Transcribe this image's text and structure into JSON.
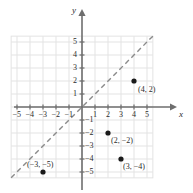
{
  "chart_data": {
    "type": "scatter",
    "title": "",
    "xlabel": "x",
    "ylabel": "y",
    "xlim": [
      -5.9,
      5.9
    ],
    "ylim": [
      -5.9,
      5.9
    ],
    "grid": true,
    "legend": "none",
    "x_ticks": [
      {
        "value": -5,
        "label": "−5"
      },
      {
        "value": -4,
        "label": "−4"
      },
      {
        "value": -3,
        "label": "−3"
      },
      {
        "value": -2,
        "label": "−2"
      },
      {
        "value": -1,
        "label": "−1"
      },
      {
        "value": 1,
        "label": "1"
      },
      {
        "value": 2,
        "label": "2"
      },
      {
        "value": 3,
        "label": "3"
      },
      {
        "value": 4,
        "label": "4"
      },
      {
        "value": 5,
        "label": "5"
      }
    ],
    "y_ticks": [
      {
        "value": 5,
        "label": "5"
      },
      {
        "value": 4,
        "label": "4"
      },
      {
        "value": 3,
        "label": "3"
      },
      {
        "value": 2,
        "label": "2"
      },
      {
        "value": 1,
        "label": "1"
      },
      {
        "value": -1,
        "label": "−1"
      },
      {
        "value": -2,
        "label": "−2"
      },
      {
        "value": -3,
        "label": "−3"
      },
      {
        "value": -4,
        "label": "−4"
      },
      {
        "value": -5,
        "label": "−5"
      }
    ],
    "points": [
      {
        "x": 4,
        "y": 2,
        "label": "(4, 2)"
      },
      {
        "x": 2,
        "y": -2,
        "label": "(2, −2)"
      },
      {
        "x": 3,
        "y": -4,
        "label": "(3, −4)"
      },
      {
        "x": -3,
        "y": -5,
        "label": "(−3, −5)"
      }
    ],
    "reference_line": {
      "style": "dashed",
      "equation": "y = x",
      "slope": 1,
      "intercept": 0
    },
    "colors": {
      "grid": "#e3e3e3",
      "axis": "#6e6e6e",
      "point": "#1a1a1a",
      "dashed_line": "#8a8a8a",
      "text": "#2b2b2b",
      "background": "#ffffff"
    }
  }
}
